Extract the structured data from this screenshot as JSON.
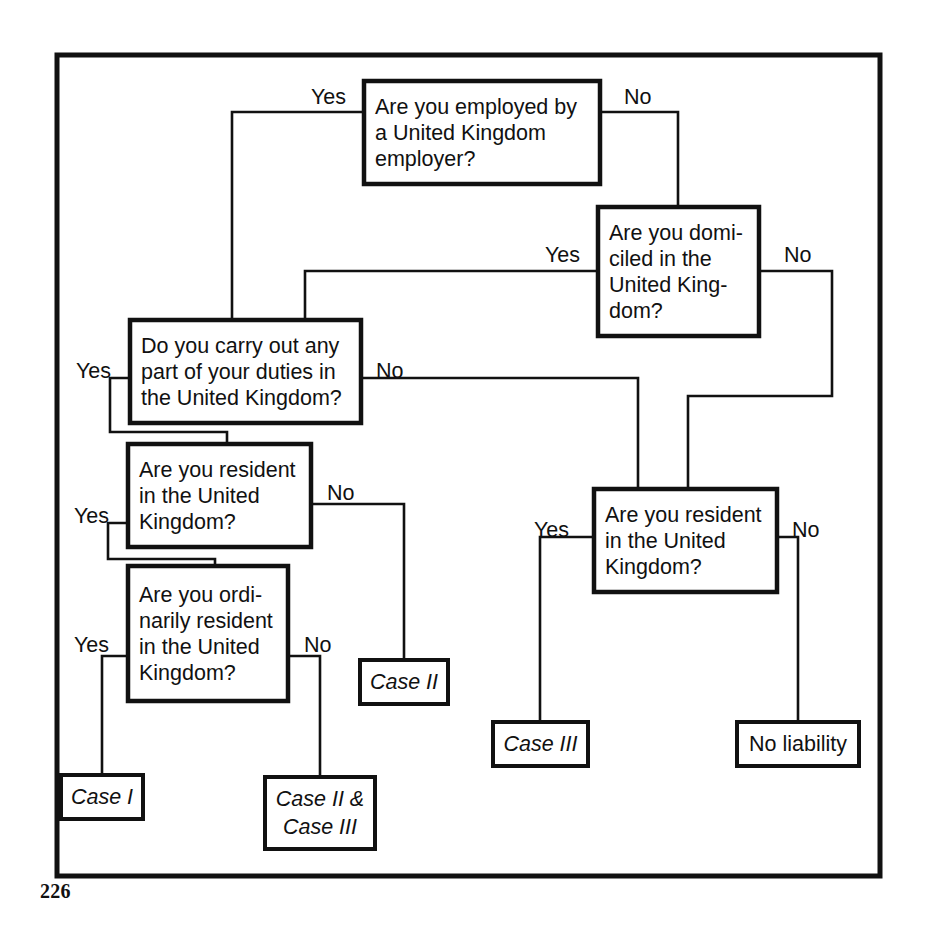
{
  "figure": {
    "page_number": "226",
    "frame": {
      "x": 57,
      "y": 55,
      "width": 823,
      "height": 821
    }
  },
  "labels": {
    "yes": "Yes",
    "no": "No"
  },
  "nodes": {
    "q_employed": {
      "id": "q-employed-by-uk-employer",
      "lines": [
        "Are you employed by",
        "a United Kingdom",
        "employer?"
      ],
      "box": {
        "x": 364,
        "y": 81,
        "width": 236,
        "height": 103
      }
    },
    "q_domiciled": {
      "id": "q-domiciled-in-uk",
      "lines": [
        "Are you domi-",
        "ciled in the",
        "United King-",
        "dom?"
      ],
      "box": {
        "x": 598,
        "y": 207,
        "width": 161,
        "height": 129
      }
    },
    "q_duties": {
      "id": "q-duties-in-uk",
      "lines": [
        "Do you carry out any",
        "part of your duties in",
        "the United Kingdom?"
      ],
      "box": {
        "x": 130,
        "y": 320,
        "width": 231,
        "height": 103
      }
    },
    "q_resident_left": {
      "id": "q-resident-in-uk-left",
      "lines": [
        "Are you resident",
        "in the United",
        "Kingdom?"
      ],
      "box": {
        "x": 128,
        "y": 444,
        "width": 183,
        "height": 103
      }
    },
    "q_ordinarily_resident": {
      "id": "q-ordinarily-resident-in-uk",
      "lines": [
        "Are you ordi-",
        "narily resident",
        "in the United",
        "Kingdom?"
      ],
      "box": {
        "x": 128,
        "y": 566,
        "width": 160,
        "height": 135
      }
    },
    "q_resident_right": {
      "id": "q-resident-in-uk-right",
      "lines": [
        "Are you resident",
        "in the United",
        "Kingdom?"
      ],
      "box": {
        "x": 594,
        "y": 489,
        "width": 183,
        "height": 103
      }
    }
  },
  "terminals": {
    "case_1": {
      "id": "case-i",
      "lines": [
        "Case I"
      ],
      "italic": true,
      "box": {
        "x": 61,
        "y": 775,
        "width": 82,
        "height": 44
      }
    },
    "case_2": {
      "id": "case-ii",
      "lines": [
        "Case II"
      ],
      "italic": true,
      "box": {
        "x": 360,
        "y": 660,
        "width": 88,
        "height": 44
      }
    },
    "case_2_and_3": {
      "id": "case-ii-and-case-iii",
      "lines": [
        "Case II &",
        "Case III"
      ],
      "italic": true,
      "box": {
        "x": 265,
        "y": 777,
        "width": 110,
        "height": 72
      }
    },
    "case_3": {
      "id": "case-iii",
      "lines": [
        "Case III"
      ],
      "italic": true,
      "box": {
        "x": 493,
        "y": 722,
        "width": 95,
        "height": 44
      }
    },
    "no_liability": {
      "id": "no-liability",
      "lines": [
        "No liability"
      ],
      "italic": false,
      "box": {
        "x": 737,
        "y": 722,
        "width": 122,
        "height": 44
      }
    }
  },
  "branch_labels": [
    {
      "id": "employed-yes",
      "text": "Yes",
      "x": 311,
      "y": 104
    },
    {
      "id": "employed-no",
      "text": "No",
      "x": 624,
      "y": 104
    },
    {
      "id": "domiciled-yes",
      "text": "Yes",
      "x": 545,
      "y": 262
    },
    {
      "id": "domiciled-no",
      "text": "No",
      "x": 784,
      "y": 262
    },
    {
      "id": "duties-yes",
      "text": "Yes",
      "x": 76,
      "y": 378
    },
    {
      "id": "duties-no",
      "text": "No",
      "x": 376,
      "y": 378
    },
    {
      "id": "resident-left-yes",
      "text": "Yes",
      "x": 74,
      "y": 523
    },
    {
      "id": "resident-left-no",
      "text": "No",
      "x": 327,
      "y": 500
    },
    {
      "id": "ordinarily-yes",
      "text": "Yes",
      "x": 74,
      "y": 652
    },
    {
      "id": "ordinarily-no",
      "text": "No",
      "x": 304,
      "y": 652
    },
    {
      "id": "resident-right-yes",
      "text": "Yes",
      "x": 534,
      "y": 537
    },
    {
      "id": "resident-right-no",
      "text": "No",
      "x": 792,
      "y": 537
    }
  ],
  "connectors": [
    {
      "id": "employed-yes-to-duties",
      "path": "M 364 112 L 232 112 L 232 320"
    },
    {
      "id": "employed-no-to-domiciled",
      "path": "M 600 112 L 678 112 L 678 207"
    },
    {
      "id": "domiciled-yes-to-duties",
      "path": "M 598 271 L 305 271 L 305 320"
    },
    {
      "id": "domiciled-no-to-resident-right",
      "path": "M 759 271 L 832 271 L 832 396 L 688 396 L 688 489"
    },
    {
      "id": "duties-yes-to-resident-left",
      "path": "M 130 378 L 110 378 L 110 432 L 227 432 L 227 444"
    },
    {
      "id": "duties-no-to-resident-right",
      "path": "M 361 378 L 638 378 L 638 489"
    },
    {
      "id": "resident-left-yes-to-ordinarily",
      "path": "M 128 523 L 108 523 L 108 559 L 215 559 L 215 566"
    },
    {
      "id": "resident-left-no-to-case-2",
      "path": "M 311 504 L 404 504 L 404 660"
    },
    {
      "id": "ordinarily-yes-to-case-1",
      "path": "M 128 656 L 102 656 L 102 775"
    },
    {
      "id": "ordinarily-no-to-case-2-and-3",
      "path": "M 288 656 L 320 656 L 320 777"
    },
    {
      "id": "resident-right-yes-to-case-3",
      "path": "M 594 537 L 540 537 L 540 722"
    },
    {
      "id": "resident-right-no-to-no-liability",
      "path": "M 777 537 L 798 537 L 798 722"
    }
  ]
}
